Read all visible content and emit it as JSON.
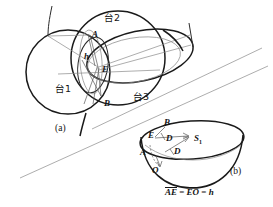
{
  "figure": {
    "panel_a": {
      "caption": "(a)",
      "region_labels": [
        {
          "name": "tai1",
          "text": "台1",
          "x": 55,
          "y": 84
        },
        {
          "name": "tai2",
          "text": "台2",
          "x": 104,
          "y": 13
        },
        {
          "name": "tai3",
          "text": "台3",
          "x": 133,
          "y": 92
        }
      ],
      "point_labels": [
        {
          "name": "point-a",
          "text": "A",
          "x": 92,
          "y": 30
        },
        {
          "name": "point-h",
          "text": "h",
          "x": 84,
          "y": 52
        },
        {
          "name": "point-e",
          "text": "E",
          "x": 102,
          "y": 65
        },
        {
          "name": "point-b",
          "text": "B",
          "x": 104,
          "y": 99
        }
      ]
    },
    "panel_b": {
      "caption": "(b)",
      "point_labels": [
        {
          "name": "point-b-top",
          "text": "B",
          "x": 164,
          "y": 120
        },
        {
          "name": "point-e-rim",
          "text": "E",
          "x": 151,
          "y": 134
        },
        {
          "name": "point-d-upper",
          "text": "D",
          "x": 166,
          "y": 137
        },
        {
          "name": "point-s1",
          "text": "S",
          "sub": "1",
          "x": 196,
          "y": 138
        },
        {
          "name": "point-a-left",
          "text": "A",
          "x": 144,
          "y": 150
        },
        {
          "name": "point-d-lower",
          "text": "D",
          "x": 174,
          "y": 150
        },
        {
          "name": "point-o-bottom",
          "text": "O",
          "x": 155,
          "y": 168
        }
      ],
      "equation": {
        "term1": "AE",
        "rel1": "=",
        "term2": "EO",
        "rel2": "=",
        "term3": "h"
      }
    }
  }
}
